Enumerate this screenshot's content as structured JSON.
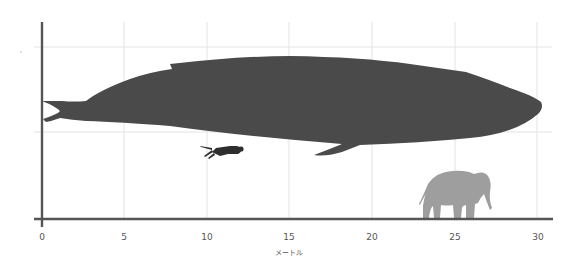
{
  "figure": {
    "title": "",
    "x_axis": {
      "label": "メートル",
      "ticks": [
        "0",
        "5",
        "10",
        "15",
        "20",
        "25",
        "30"
      ],
      "tick_values": [
        0,
        5,
        10,
        15,
        20,
        25,
        30
      ],
      "range": [
        0,
        30.5
      ]
    },
    "colors": {
      "whale": "#4a4a4a",
      "diver": "#2e2e2e",
      "elephant": "#9e9e9e",
      "axis": "#555555",
      "grid": "#e3e3e3"
    },
    "silhouettes": [
      {
        "name": "blue-whale",
        "length_m_approx": 30
      },
      {
        "name": "scuba-diver",
        "length_m_approx": 2.5
      },
      {
        "name": "elephant",
        "length_m_approx": 4.5
      }
    ]
  }
}
